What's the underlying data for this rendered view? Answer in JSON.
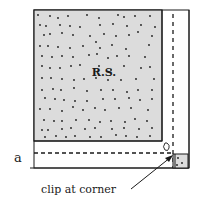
{
  "diagram": {
    "center_label": "R.S.",
    "seam_label": "a",
    "callout_label": "clip at corner",
    "colors": {
      "fabric_fill": "#dcdcdc",
      "stroke": "#1a1a1a",
      "background": "#ffffff"
    },
    "dots": [
      [
        38,
        15
      ],
      [
        50,
        16
      ],
      [
        58,
        18
      ],
      [
        68,
        16
      ],
      [
        87,
        15
      ],
      [
        99,
        18
      ],
      [
        118,
        15
      ],
      [
        124,
        17
      ],
      [
        135,
        16
      ],
      [
        150,
        16
      ],
      [
        40,
        25
      ],
      [
        46,
        26
      ],
      [
        60,
        25
      ],
      [
        70,
        26
      ],
      [
        80,
        27
      ],
      [
        100,
        25
      ],
      [
        113,
        24
      ],
      [
        127,
        26
      ],
      [
        141,
        25
      ],
      [
        155,
        27
      ],
      [
        44,
        35
      ],
      [
        50,
        34
      ],
      [
        62,
        33
      ],
      [
        73,
        35
      ],
      [
        90,
        36
      ],
      [
        104,
        34
      ],
      [
        116,
        36
      ],
      [
        129,
        35
      ],
      [
        138,
        32
      ],
      [
        152,
        36
      ],
      [
        40,
        46
      ],
      [
        48,
        46
      ],
      [
        58,
        47
      ],
      [
        70,
        48
      ],
      [
        83,
        46
      ],
      [
        96,
        42
      ],
      [
        100,
        48
      ],
      [
        112,
        45
      ],
      [
        126,
        49
      ],
      [
        149,
        45
      ],
      [
        42,
        56
      ],
      [
        52,
        57
      ],
      [
        62,
        56
      ],
      [
        73,
        57
      ],
      [
        89,
        55
      ],
      [
        97,
        54
      ],
      [
        108,
        58
      ],
      [
        117,
        56
      ],
      [
        129,
        56
      ],
      [
        145,
        57
      ],
      [
        42,
        66
      ],
      [
        50,
        68
      ],
      [
        60,
        68
      ],
      [
        71,
        66
      ],
      [
        80,
        65
      ],
      [
        99,
        66
      ],
      [
        111,
        70
      ],
      [
        124,
        66
      ],
      [
        141,
        68
      ],
      [
        150,
        67
      ],
      [
        42,
        78
      ],
      [
        51,
        78
      ],
      [
        62,
        79
      ],
      [
        74,
        80
      ],
      [
        84,
        79
      ],
      [
        96,
        78
      ],
      [
        108,
        80
      ],
      [
        121,
        80
      ],
      [
        136,
        79
      ],
      [
        154,
        79
      ],
      [
        42,
        90
      ],
      [
        53,
        89
      ],
      [
        61,
        90
      ],
      [
        74,
        88
      ],
      [
        87,
        91
      ],
      [
        101,
        90
      ],
      [
        113,
        90
      ],
      [
        127,
        92
      ],
      [
        138,
        90
      ],
      [
        152,
        90
      ],
      [
        45,
        98
      ],
      [
        55,
        99
      ],
      [
        64,
        100
      ],
      [
        75,
        101
      ],
      [
        87,
        101
      ],
      [
        103,
        99
      ],
      [
        115,
        99
      ],
      [
        129,
        98
      ],
      [
        140,
        100
      ],
      [
        152,
        99
      ],
      [
        40,
        109
      ],
      [
        50,
        109
      ],
      [
        62,
        111
      ],
      [
        73,
        107
      ],
      [
        83,
        110
      ],
      [
        95,
        108
      ],
      [
        105,
        110
      ],
      [
        119,
        108
      ],
      [
        131,
        108
      ],
      [
        148,
        110
      ],
      [
        44,
        120
      ],
      [
        54,
        121
      ],
      [
        62,
        121
      ],
      [
        76,
        120
      ],
      [
        89,
        120
      ],
      [
        100,
        122
      ],
      [
        111,
        121
      ],
      [
        125,
        122
      ],
      [
        135,
        119
      ],
      [
        147,
        121
      ],
      [
        42,
        130
      ],
      [
        48,
        130
      ],
      [
        62,
        129
      ],
      [
        71,
        128
      ],
      [
        85,
        129
      ],
      [
        95,
        128
      ],
      [
        112,
        129
      ],
      [
        124,
        128
      ],
      [
        139,
        129
      ],
      [
        152,
        128
      ],
      [
        45,
        137
      ],
      [
        56,
        136
      ],
      [
        66,
        137
      ],
      [
        75,
        136
      ],
      [
        90,
        137
      ],
      [
        101,
        137
      ],
      [
        116,
        135
      ],
      [
        126,
        136
      ],
      [
        137,
        137
      ],
      [
        150,
        136
      ]
    ],
    "corner_dots": [
      [
        178,
        158
      ],
      [
        182,
        163
      ],
      [
        177,
        165
      ]
    ]
  }
}
